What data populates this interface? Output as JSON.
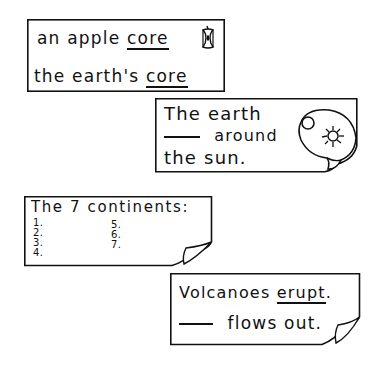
{
  "cards": [
    {
      "id": "core",
      "lines": [
        {
          "before": "an apple ",
          "underlined": "core",
          "icon": "apple-core-icon"
        },
        {
          "before": "the earth's ",
          "underlined": "core"
        }
      ]
    },
    {
      "id": "revolves",
      "lines": [
        {
          "text": "The earth"
        },
        {
          "blank": "____",
          "text": " around"
        },
        {
          "text": "the sun."
        }
      ],
      "icon": "sun-and-earth-icon"
    },
    {
      "id": "continents",
      "title": "The 7 continents:",
      "numbers_left": [
        "1.",
        "2.",
        "3.",
        "4."
      ],
      "numbers_right": [
        "5.",
        "6.",
        "7."
      ]
    },
    {
      "id": "volcanoes",
      "lines": [
        {
          "before": "Volcanoes ",
          "underlined": "erupt",
          "after": "."
        },
        {
          "blank": "____",
          "text": " flows out."
        }
      ]
    }
  ],
  "colors": {
    "ink": "#111111",
    "paper": "#ffffff"
  }
}
